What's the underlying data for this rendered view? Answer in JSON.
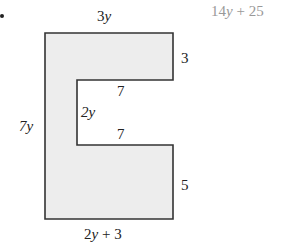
{
  "problem": {
    "answer": "14y + 25",
    "colors": {
      "fill": "#ededed",
      "stroke": "#333333",
      "answer": "#999999"
    }
  },
  "shape": {
    "labels": {
      "top": "3y",
      "left": "7y",
      "right_top": "3",
      "notch_top": "7",
      "notch_side": "2y",
      "notch_bottom": "7",
      "right_bottom": "5",
      "bottom": "2y + 3"
    }
  }
}
